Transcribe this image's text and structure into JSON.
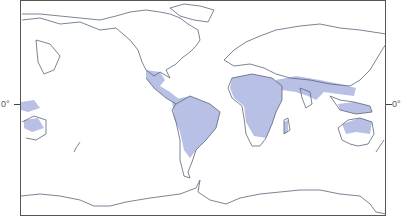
{
  "map": {
    "projection": "world-equirectangular",
    "equator_label_left": "0°",
    "equator_label_right": "0°",
    "colors": {
      "land_outline": "#5a6478",
      "highlight_region": "#b8c0e6",
      "background": "#ffffff",
      "frame": "#555555"
    },
    "highlighted_regions": [
      "Central America and Caribbean",
      "Northern and Central South America",
      "Sub-Saharan and North Africa",
      "Arabian Peninsula",
      "South Asia (India)",
      "Southeast Asia",
      "Indonesia and New Guinea",
      "Northern Australia",
      "Madagascar"
    ]
  }
}
